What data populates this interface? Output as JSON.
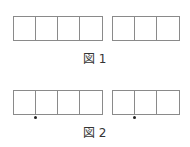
{
  "figure1": {
    "caption": "図 1",
    "groups": [
      {
        "cells": 4
      },
      {
        "cells": 3
      }
    ]
  },
  "figure2": {
    "caption": "図 2",
    "groups": [
      {
        "cells": 4
      },
      {
        "cells": 3
      }
    ],
    "dots": [
      {
        "group": 0,
        "position": "between cell 1 and cell 2"
      },
      {
        "group": 1,
        "position": "between cell 1 and cell 2"
      }
    ]
  },
  "colors": {
    "line": "#8a8a8a",
    "dot": "#222222",
    "text": "#333333"
  }
}
